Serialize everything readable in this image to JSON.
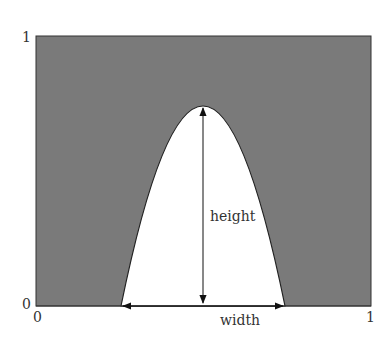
{
  "diagram": {
    "type": "parabola-in-unit-square",
    "axis": {
      "x_min_label": "0",
      "x_max_label": "1",
      "y_min_label": "0",
      "y_max_label": "1"
    },
    "curve": {
      "shape": "inverted parabola",
      "x_left": 0.25,
      "x_right": 0.74,
      "peak_x": 0.5,
      "peak_y": 0.74
    },
    "annotations": {
      "height_label": "height",
      "width_label": "width"
    },
    "colors": {
      "fill_outside": "#7a7a7a",
      "fill_inside": "#ffffff",
      "stroke": "#222222",
      "text": "#333333"
    }
  }
}
